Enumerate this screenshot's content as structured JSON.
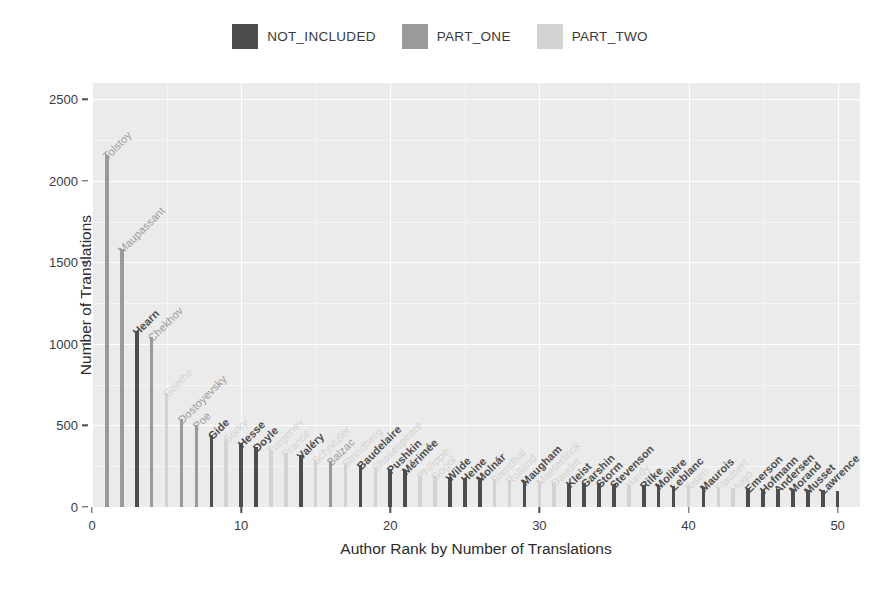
{
  "legend": {
    "position": "top",
    "entries": [
      {
        "label": "NOT_INCLUDED",
        "color": "#4d4d4d"
      },
      {
        "label": "PART_ONE",
        "color": "#9a9a9a"
      },
      {
        "label": "PART_TWO",
        "color": "#d3d3d3"
      }
    ]
  },
  "axes": {
    "y_title": "Number of Translations",
    "x_title": "Author Rank by Number of Translations",
    "y_ticks": [
      0,
      500,
      1000,
      1500,
      2000,
      2500
    ],
    "x_ticks": [
      0,
      10,
      20,
      30,
      40,
      50
    ]
  },
  "chart_data": {
    "type": "bar",
    "title": "",
    "xlabel": "Author Rank by Number of Translations",
    "ylabel": "Number of Translations",
    "xlim": [
      0,
      51.5
    ],
    "ylim": [
      0,
      2600
    ],
    "grid": true,
    "legend_position": "top",
    "categories_axis": "rank",
    "series_colors": {
      "NOT_INCLUDED": "#4d4d4d",
      "PART_ONE": "#9a9a9a",
      "PART_TWO": "#d3d3d3"
    },
    "points": [
      {
        "rank": 1,
        "author": "Tolstoy",
        "value": 2160,
        "group": "PART_ONE"
      },
      {
        "rank": 2,
        "author": "Maupassant",
        "value": 1580,
        "group": "PART_ONE"
      },
      {
        "rank": 3,
        "author": "Hearn",
        "value": 1080,
        "group": "NOT_INCLUDED"
      },
      {
        "rank": 4,
        "author": "Chekhov",
        "value": 1040,
        "group": "PART_ONE"
      },
      {
        "rank": 5,
        "author": "Goethe",
        "value": 700,
        "group": "PART_TWO"
      },
      {
        "rank": 6,
        "author": "Dostoyevsky",
        "value": 540,
        "group": "PART_ONE"
      },
      {
        "rank": 7,
        "author": "Poe",
        "value": 500,
        "group": "PART_ONE"
      },
      {
        "rank": 8,
        "author": "Gide",
        "value": 440,
        "group": "NOT_INCLUDED"
      },
      {
        "rank": 9,
        "author": "Gorky",
        "value": 420,
        "group": "PART_TWO"
      },
      {
        "rank": 10,
        "author": "Hesse",
        "value": 390,
        "group": "NOT_INCLUDED"
      },
      {
        "rank": 11,
        "author": "Doyle",
        "value": 370,
        "group": "NOT_INCLUDED"
      },
      {
        "rank": 12,
        "author": "Turgenev",
        "value": 350,
        "group": "PART_TWO"
      },
      {
        "rank": 13,
        "author": "France",
        "value": 330,
        "group": "PART_TWO"
      },
      {
        "rank": 14,
        "author": "Valéry",
        "value": 320,
        "group": "NOT_INCLUDED"
      },
      {
        "rank": 15,
        "author": "Schnitzler",
        "value": 290,
        "group": "PART_TWO"
      },
      {
        "rank": 16,
        "author": "Balzac",
        "value": 280,
        "group": "PART_ONE"
      },
      {
        "rank": 17,
        "author": "Strindberg",
        "value": 270,
        "group": "PART_TWO"
      },
      {
        "rank": 18,
        "author": "Baudelaire",
        "value": 255,
        "group": "NOT_INCLUDED"
      },
      {
        "rank": 19,
        "author": "Shakespeare",
        "value": 245,
        "group": "PART_TWO"
      },
      {
        "rank": 20,
        "author": "Pushkin",
        "value": 235,
        "group": "NOT_INCLUDED"
      },
      {
        "rank": 21,
        "author": "Mérimée",
        "value": 225,
        "group": "NOT_INCLUDED"
      },
      {
        "rank": 22,
        "author": "Philippe",
        "value": 195,
        "group": "PART_TWO"
      },
      {
        "rank": 23,
        "author": "Gogol",
        "value": 190,
        "group": "PART_TWO"
      },
      {
        "rank": 24,
        "author": "Wilde",
        "value": 185,
        "group": "NOT_INCLUDED"
      },
      {
        "rank": 25,
        "author": "Heine",
        "value": 180,
        "group": "NOT_INCLUDED"
      },
      {
        "rank": 26,
        "author": "Molnár",
        "value": 175,
        "group": "NOT_INCLUDED"
      },
      {
        "rank": 27,
        "author": "Stendhal",
        "value": 170,
        "group": "PART_TWO"
      },
      {
        "rank": 28,
        "author": "Rolland",
        "value": 165,
        "group": "PART_TWO"
      },
      {
        "rank": 29,
        "author": "Maugham",
        "value": 160,
        "group": "NOT_INCLUDED"
      },
      {
        "rank": 30,
        "author": "Maeterlinck",
        "value": 158,
        "group": "PART_TWO"
      },
      {
        "rank": 31,
        "author": "Daudet",
        "value": 155,
        "group": "PART_TWO"
      },
      {
        "rank": 32,
        "author": "Kleist",
        "value": 150,
        "group": "NOT_INCLUDED"
      },
      {
        "rank": 33,
        "author": "Garshin",
        "value": 148,
        "group": "NOT_INCLUDED"
      },
      {
        "rank": 34,
        "author": "Storm",
        "value": 145,
        "group": "NOT_INCLUDED"
      },
      {
        "rank": 35,
        "author": "Stevenson",
        "value": 142,
        "group": "NOT_INCLUDED"
      },
      {
        "rank": 36,
        "author": "Hardy",
        "value": 138,
        "group": "PART_TWO"
      },
      {
        "rank": 37,
        "author": "Rilke",
        "value": 135,
        "group": "NOT_INCLUDED"
      },
      {
        "rank": 38,
        "author": "Molière",
        "value": 132,
        "group": "NOT_INCLUDED"
      },
      {
        "rank": 39,
        "author": "Leblanc",
        "value": 130,
        "group": "NOT_INCLUDED"
      },
      {
        "rank": 40,
        "author": "Ibsen",
        "value": 126,
        "group": "PART_TWO"
      },
      {
        "rank": 41,
        "author": "Maurois",
        "value": 124,
        "group": "NOT_INCLUDED"
      },
      {
        "rank": 42,
        "author": "Flaubert",
        "value": 120,
        "group": "PART_TWO"
      },
      {
        "rank": 43,
        "author": "Hugo",
        "value": 118,
        "group": "PART_TWO"
      },
      {
        "rank": 44,
        "author": "Emerson",
        "value": 115,
        "group": "NOT_INCLUDED"
      },
      {
        "rank": 45,
        "author": "Hofmann",
        "value": 112,
        "group": "NOT_INCLUDED"
      },
      {
        "rank": 46,
        "author": "Andersen",
        "value": 110,
        "group": "NOT_INCLUDED"
      },
      {
        "rank": 47,
        "author": "Morand",
        "value": 108,
        "group": "NOT_INCLUDED"
      },
      {
        "rank": 48,
        "author": "Musset",
        "value": 105,
        "group": "NOT_INCLUDED"
      },
      {
        "rank": 49,
        "author": "Lawrence",
        "value": 102,
        "group": "NOT_INCLUDED"
      },
      {
        "rank": 50,
        "author": "",
        "value": 100,
        "group": "NOT_INCLUDED"
      }
    ]
  }
}
